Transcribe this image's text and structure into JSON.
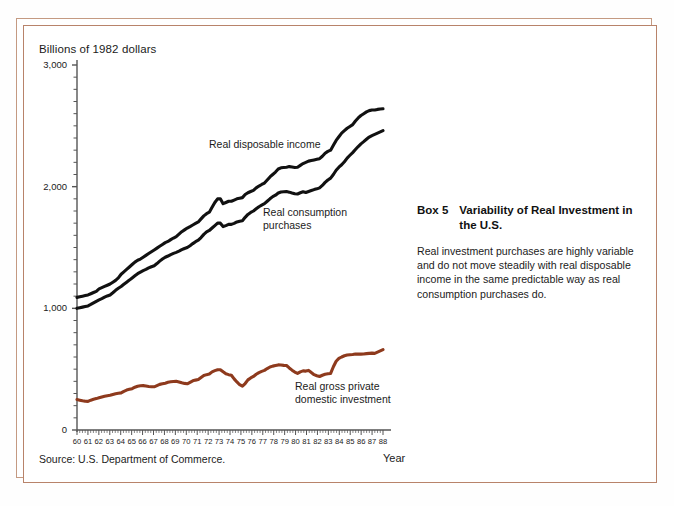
{
  "figure": {
    "y_axis_title": "Billions of 1982 dollars",
    "x_axis_name": "Year",
    "source": "Source: U.S. Department of Commerce.",
    "bottom_caption": ""
  },
  "box": {
    "number": "Box 5",
    "title": "Variability of Real Investment in the U.S.",
    "body": "Real investment purchases are highly variable and do not move steadily with real disposable income in the same predictable way as real consumption purchases do."
  },
  "series_labels": {
    "income": "Real disposable income",
    "consumption_line1": "Real consumption",
    "consumption_line2": "purchases",
    "investment_line1": "Real gross private",
    "investment_line2": "domestic investment"
  },
  "colors": {
    "income_line": "#111111",
    "consumption_line": "#111111",
    "investment_line": "#8e3a1d",
    "frame_outer": "#c49a82",
    "frame_inner": "#b8836a",
    "axis": "#555555",
    "background": "#ffffff"
  },
  "chart_data": {
    "type": "line",
    "title": "",
    "xlabel": "Year",
    "ylabel": "Billions of 1982 dollars",
    "xlim": [
      60,
      88
    ],
    "ylim": [
      0,
      3000
    ],
    "yticks": [
      0,
      1000,
      2000,
      3000
    ],
    "ytick_labels": [
      "0",
      "1,000",
      "2,000",
      "3,000"
    ],
    "y_minor_tick_step": 100,
    "grid": false,
    "legend": "inline-annotations",
    "x": [
      60,
      61,
      62,
      63,
      64,
      65,
      66,
      67,
      68,
      69,
      70,
      71,
      72,
      73,
      74,
      75,
      76,
      77,
      78,
      79,
      80,
      81,
      82,
      83,
      84,
      85,
      86,
      87,
      88
    ],
    "xtick_labels": [
      "60",
      "61",
      "62",
      "63",
      "64",
      "65",
      "66",
      "67",
      "68",
      "69",
      "70",
      "71",
      "72",
      "73",
      "74",
      "75",
      "76",
      "77",
      "78",
      "79",
      "80",
      "81",
      "82",
      "83",
      "84",
      "85",
      "86",
      "87",
      "88"
    ],
    "series": [
      {
        "name": "Real disposable income",
        "color": "#111111",
        "values": [
          1090,
          1110,
          1160,
          1200,
          1280,
          1360,
          1420,
          1480,
          1540,
          1590,
          1660,
          1710,
          1790,
          1900,
          1880,
          1910,
          1970,
          2030,
          2120,
          2160,
          2160,
          2210,
          2230,
          2300,
          2440,
          2510,
          2600,
          2630,
          2640
        ],
        "quarterly_detail": [
          1090,
          1095,
          1100,
          1105,
          1110,
          1120,
          1130,
          1140,
          1160,
          1170,
          1180,
          1190,
          1200,
          1215,
          1230,
          1250,
          1280,
          1300,
          1320,
          1340,
          1360,
          1380,
          1395,
          1405,
          1420,
          1435,
          1450,
          1465,
          1480,
          1495,
          1510,
          1525,
          1540,
          1550,
          1565,
          1578,
          1590,
          1610,
          1630,
          1645,
          1660,
          1672,
          1685,
          1698,
          1710,
          1735,
          1760,
          1778,
          1790,
          1830,
          1870,
          1900,
          1900,
          1860,
          1870,
          1880,
          1880,
          1890,
          1900,
          1905,
          1910,
          1935,
          1950,
          1960,
          1970,
          1990,
          2005,
          2018,
          2030,
          2055,
          2080,
          2100,
          2120,
          2145,
          2155,
          2158,
          2160,
          2165,
          2162,
          2158,
          2160,
          2175,
          2190,
          2200,
          2210,
          2215,
          2220,
          2225,
          2230,
          2250,
          2275,
          2290,
          2300,
          2340,
          2380,
          2410,
          2440,
          2460,
          2480,
          2495,
          2510,
          2540,
          2565,
          2585,
          2600,
          2615,
          2625,
          2630,
          2630,
          2635,
          2638,
          2640
        ]
      },
      {
        "name": "Real consumption purchases",
        "color": "#111111",
        "values": [
          1000,
          1020,
          1070,
          1110,
          1180,
          1250,
          1310,
          1350,
          1420,
          1460,
          1500,
          1560,
          1640,
          1700,
          1690,
          1720,
          1800,
          1860,
          1930,
          1960,
          1940,
          1960,
          1990,
          2070,
          2180,
          2280,
          2370,
          2430,
          2460
        ],
        "quarterly_detail": [
          1000,
          1005,
          1010,
          1015,
          1020,
          1032,
          1045,
          1058,
          1070,
          1080,
          1092,
          1102,
          1110,
          1128,
          1148,
          1165,
          1180,
          1198,
          1215,
          1232,
          1250,
          1268,
          1285,
          1298,
          1310,
          1320,
          1332,
          1342,
          1350,
          1368,
          1388,
          1405,
          1420,
          1430,
          1442,
          1452,
          1460,
          1470,
          1482,
          1492,
          1500,
          1515,
          1532,
          1548,
          1560,
          1582,
          1608,
          1628,
          1640,
          1660,
          1680,
          1700,
          1700,
          1672,
          1680,
          1690,
          1690,
          1698,
          1710,
          1716,
          1720,
          1748,
          1772,
          1788,
          1800,
          1818,
          1835,
          1848,
          1860,
          1880,
          1900,
          1918,
          1930,
          1948,
          1956,
          1958,
          1960,
          1955,
          1948,
          1942,
          1940,
          1950,
          1958,
          1952,
          1960,
          1968,
          1976,
          1982,
          1990,
          2010,
          2035,
          2055,
          2070,
          2100,
          2135,
          2160,
          2180,
          2205,
          2235,
          2258,
          2280,
          2305,
          2330,
          2352,
          2370,
          2390,
          2408,
          2420,
          2430,
          2440,
          2450,
          2460
        ]
      },
      {
        "name": "Real gross private domestic investment",
        "color": "#8e3a1d",
        "values": [
          250,
          235,
          265,
          285,
          305,
          340,
          365,
          355,
          385,
          400,
          380,
          415,
          460,
          495,
          450,
          360,
          440,
          490,
          530,
          530,
          465,
          490,
          440,
          465,
          600,
          620,
          625,
          630,
          660
        ],
        "quarterly_detail": [
          250,
          245,
          240,
          236,
          235,
          245,
          252,
          258,
          265,
          272,
          278,
          282,
          285,
          292,
          298,
          302,
          305,
          318,
          328,
          334,
          340,
          352,
          360,
          364,
          365,
          362,
          358,
          356,
          355,
          365,
          375,
          380,
          385,
          392,
          396,
          398,
          400,
          395,
          388,
          383,
          380,
          392,
          404,
          410,
          415,
          432,
          448,
          455,
          460,
          478,
          488,
          495,
          495,
          478,
          462,
          455,
          450,
          420,
          395,
          372,
          360,
          382,
          412,
          428,
          440,
          458,
          472,
          482,
          490,
          505,
          518,
          525,
          530,
          535,
          534,
          531,
          530,
          510,
          492,
          476,
          465,
          478,
          486,
          484,
          490,
          472,
          455,
          446,
          440,
          450,
          458,
          462,
          465,
          520,
          565,
          588,
          600,
          610,
          616,
          619,
          620,
          624,
          625,
          624,
          625,
          628,
          630,
          632,
          630,
          640,
          650,
          660
        ]
      }
    ]
  }
}
